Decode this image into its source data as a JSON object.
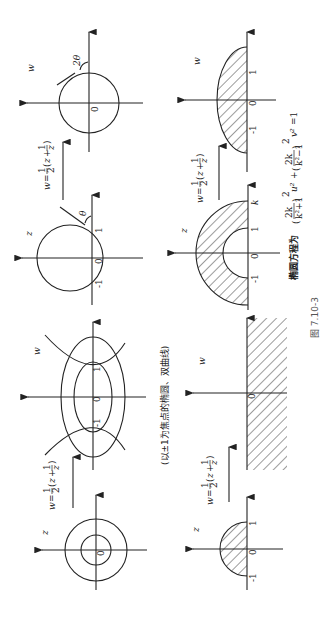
{
  "figure": {
    "caption": "图 7.10-3",
    "rotation_deg": -90,
    "mapping_label": "w = 1/2 (z + 1/z)",
    "mapping_parts": {
      "w": "w",
      "eq": "=",
      "half_num": "1",
      "half_den": "2",
      "z": "z",
      "plus": "+",
      "inv_num": "1",
      "inv_den": "z"
    },
    "rows": [
      {
        "z_panel": {
          "plane_label": "z",
          "shape": "circle through -1 and 1, center on imaginary axis",
          "tick_labels": [
            "-1",
            "0",
            "1"
          ],
          "angle_label": "θ"
        },
        "w_panel": {
          "plane_label": "w",
          "shape": "circle with tangent",
          "tick_labels": [
            "0"
          ],
          "angle_label": "2θ"
        }
      },
      {
        "z_panel": {
          "plane_label": "z",
          "shape": "concentric circles",
          "tick_labels": [
            "0"
          ]
        },
        "w_panel": {
          "plane_label": "w",
          "shape": "confocal ellipses and hyperbola",
          "tick_labels": [
            "-1",
            "0",
            "1"
          ],
          "note": "(以±1为焦点的椭圆、双曲线)"
        }
      },
      {
        "z_panel": {
          "plane_label": "z",
          "shape": "upper half annulus 1<|z|<k",
          "tick_labels": [
            "-1",
            "0",
            "1",
            "k"
          ]
        },
        "w_panel": {
          "plane_label": "w",
          "shape": "upper half ellipse",
          "tick_labels": [
            "-1",
            "0",
            "1"
          ]
        },
        "ellipse_equation": {
          "prefix": "椭圆方程为",
          "expr": "(2k/(k²+1))² u² + (2k/(k²−1))² v² = 1",
          "t1_num": "2k",
          "t1_den": "k²+1",
          "t2_num": "2k",
          "t2_den": "k²−1",
          "u2": "u²",
          "v2": "v²",
          "plus": "+",
          "eq1": "=1",
          "sq": "2"
        }
      },
      {
        "z_panel": {
          "plane_label": "z",
          "shape": "upper half unit disk",
          "tick_labels": [
            "-1",
            "0",
            "1"
          ]
        },
        "w_panel": {
          "plane_label": "w",
          "shape": "lower half plane",
          "tick_labels": [
            "0"
          ]
        }
      }
    ]
  }
}
